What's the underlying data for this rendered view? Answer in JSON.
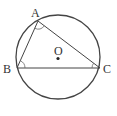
{
  "diagram": {
    "type": "geometry",
    "circle": {
      "center_label": "O",
      "cx": 58,
      "cy": 57,
      "r": 42
    },
    "points": {
      "A": {
        "label": "A",
        "x": 38,
        "y": 21
      },
      "B": {
        "label": "B",
        "x": 17,
        "y": 68
      },
      "C": {
        "label": "C",
        "x": 100,
        "y": 68
      },
      "O": {
        "label": "O",
        "x": 58,
        "y": 58
      }
    },
    "segments": [
      "AB",
      "AC",
      "BC"
    ],
    "angle_marks": [
      "A",
      "B",
      "C"
    ],
    "colors": {
      "stroke": "#444444",
      "background": "#ffffff"
    }
  }
}
